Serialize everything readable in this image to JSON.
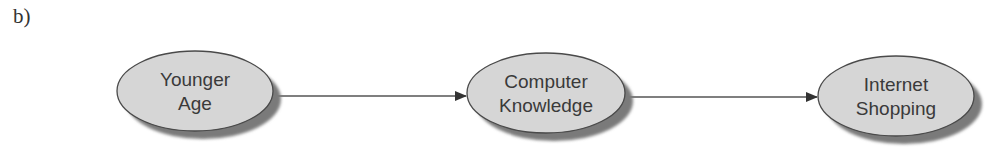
{
  "figure": {
    "panel_label": "b)"
  },
  "diagram": {
    "nodes": [
      {
        "id": "younger-age",
        "line1": "Younger",
        "line2": "Age",
        "cx": 195,
        "cy": 91,
        "rx": 78,
        "ry": 40
      },
      {
        "id": "computer-knowledge",
        "line1": "Computer",
        "line2": "Knowledge",
        "cx": 546,
        "cy": 93,
        "rx": 79,
        "ry": 40
      },
      {
        "id": "internet-shopping",
        "line1": "Internet",
        "line2": "Shopping",
        "cx": 896,
        "cy": 96,
        "rx": 78,
        "ry": 40
      }
    ],
    "edges": [
      {
        "from": "younger-age",
        "to": "computer-knowledge"
      },
      {
        "from": "computer-knowledge",
        "to": "internet-shopping"
      }
    ],
    "colors": {
      "node_fill": "#d6d6d6",
      "node_stroke": "#4a4a4a",
      "shadow": "#7a7a7a",
      "edge": "#555555",
      "text": "#3a3a3a"
    }
  }
}
